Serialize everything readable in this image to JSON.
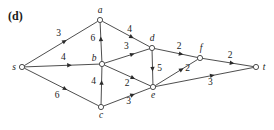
{
  "figure": {
    "panel_label": "(d)",
    "width": 274,
    "height": 130
  },
  "graph": {
    "type": "directed-flow-network",
    "source": "s",
    "sink": "t",
    "nodes": [
      {
        "id": "s",
        "label": "s",
        "x": 22,
        "y": 67,
        "label_dx": -8,
        "label_dy": 3
      },
      {
        "id": "a",
        "label": "a",
        "x": 100,
        "y": 20,
        "label_dx": 0,
        "label_dy": -7
      },
      {
        "id": "b",
        "label": "b",
        "x": 102,
        "y": 64,
        "label_dx": -8,
        "label_dy": -3
      },
      {
        "id": "c",
        "label": "c",
        "x": 101,
        "y": 107,
        "label_dx": 0,
        "label_dy": 11
      },
      {
        "id": "d",
        "label": "d",
        "x": 152,
        "y": 48,
        "label_dx": 0,
        "label_dy": -7
      },
      {
        "id": "e",
        "label": "e",
        "x": 153,
        "y": 87,
        "label_dx": 0,
        "label_dy": 11
      },
      {
        "id": "f",
        "label": "f",
        "x": 200,
        "y": 58,
        "label_dx": 1,
        "label_dy": -7
      },
      {
        "id": "t",
        "label": "t",
        "x": 256,
        "y": 67,
        "label_dx": 8,
        "label_dy": 3
      }
    ],
    "edges": [
      {
        "from": "s",
        "to": "a",
        "capacity": "3",
        "arrow_t": 0.55,
        "label_dx": -6,
        "label_dy": -5
      },
      {
        "from": "s",
        "to": "b",
        "capacity": "4",
        "arrow_t": 0.6,
        "label_dx": -6,
        "label_dy": -5
      },
      {
        "from": "s",
        "to": "c",
        "capacity": "6",
        "arrow_t": 0.55,
        "label_dx": -8,
        "label_dy": 9
      },
      {
        "from": "b",
        "to": "a",
        "capacity": "6",
        "arrow_t": 0.58,
        "label_dx": -8,
        "label_dy": 2
      },
      {
        "from": "c",
        "to": "b",
        "capacity": "4",
        "arrow_t": 0.58,
        "label_dx": -8,
        "label_dy": 2
      },
      {
        "from": "a",
        "to": "d",
        "capacity": "4",
        "arrow_t": 0.62,
        "label_dx": -2,
        "label_dy": -5
      },
      {
        "from": "b",
        "to": "d",
        "capacity": "3",
        "arrow_t": 0.62,
        "label_dx": -6,
        "label_dy": -5
      },
      {
        "from": "b",
        "to": "e",
        "capacity": "2",
        "arrow_t": 0.62,
        "label_dx": -6,
        "label_dy": 8
      },
      {
        "from": "c",
        "to": "e",
        "capacity": "3",
        "arrow_t": 0.62,
        "label_dx": -4,
        "label_dy": 9
      },
      {
        "from": "d",
        "to": "e",
        "capacity": "5",
        "arrow_t": 0.55,
        "label_dx": 7,
        "label_dy": 2
      },
      {
        "from": "d",
        "to": "f",
        "capacity": "2",
        "arrow_t": 0.62,
        "label_dx": -2,
        "label_dy": -5
      },
      {
        "from": "e",
        "to": "f",
        "capacity": "2",
        "arrow_t": 0.62,
        "label_dx": 6,
        "label_dy": 2
      },
      {
        "from": "e",
        "to": "t",
        "capacity": "3",
        "arrow_t": 0.58,
        "label_dx": -2,
        "label_dy": 10
      },
      {
        "from": "f",
        "to": "t",
        "capacity": "2",
        "arrow_t": 0.58,
        "label_dx": -2,
        "label_dy": -5
      }
    ]
  }
}
